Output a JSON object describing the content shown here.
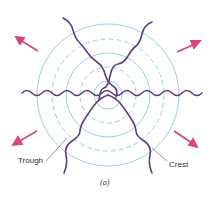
{
  "figure": {
    "labels": {
      "trough": "Trough",
      "crest": "Crest"
    },
    "caption": "(a)",
    "colors": {
      "circles": "#7fc3dd",
      "rays": "#5a3f7e",
      "arrows": "#d9457a"
    },
    "center": [
      108,
      95
    ],
    "solid_radii": [
      14,
      42,
      71
    ],
    "dashed_radii": [
      28,
      56
    ]
  }
}
